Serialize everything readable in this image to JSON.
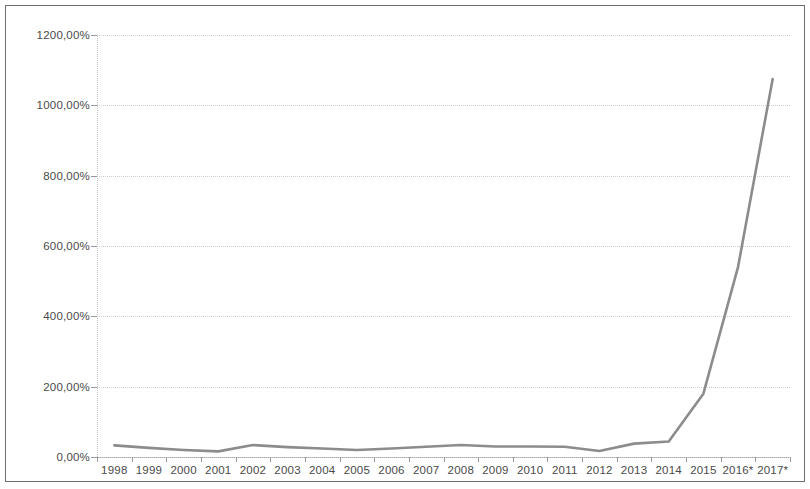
{
  "chart_data": {
    "type": "line",
    "title": "",
    "subtitle": "",
    "xlabel": "",
    "ylabel": "",
    "categories": [
      "1998",
      "1999",
      "2000",
      "2001",
      "2002",
      "2003",
      "2004",
      "2005",
      "2006",
      "2007",
      "2008",
      "2009",
      "2010",
      "2011",
      "2012",
      "2013",
      "2014",
      "2015",
      "2016*",
      "2017*"
    ],
    "series": [
      {
        "name": "",
        "values": [
          33,
          26,
          20,
          16,
          34,
          28,
          24,
          20,
          24,
          29,
          34,
          30,
          30,
          29,
          17,
          38,
          44,
          180,
          540,
          1075
        ]
      }
    ],
    "ylim": [
      0,
      1200
    ],
    "ytick_values": [
      0,
      200,
      400,
      600,
      800,
      1000,
      1200
    ],
    "ytick_labels": [
      "0,00%",
      "200,00%",
      "400,00%",
      "600,00%",
      "800,00%",
      "1000,00%",
      "1200,00%"
    ],
    "grid": true,
    "grid_axis": "y",
    "legend": false,
    "legend_position": "none",
    "line_color": "#8c8c8c",
    "grid_color": "#cfcfcf",
    "axis_color": "#a8a8a8",
    "text_color": "#4a4a4a",
    "background_color": "#ffffff",
    "border_color": "#6f6f6f"
  }
}
